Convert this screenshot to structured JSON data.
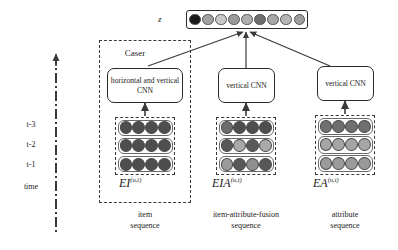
{
  "figure": {
    "output_label": "z",
    "time_axis": {
      "ticks": [
        "t-3",
        "t-2",
        "t-1",
        "time"
      ]
    },
    "output_vector": {
      "name": "z",
      "cells": [
        "#1a1a1a",
        "#a2a2a2",
        "#c9c9c9",
        "#9a9a9a",
        "#aeaeae",
        "#6e6e6e",
        "#a8a8a8",
        "#b6b6b6",
        "#9f9f9f"
      ]
    },
    "branches": [
      {
        "id": "item",
        "group_label": "Caser",
        "cnn_label": "horizontal and vertical CNN",
        "math_base": "EI",
        "math_sup": "(u,t)",
        "caption_line1": "item",
        "caption_line2": "sequence",
        "matrix": {
          "rows": 3,
          "cols": 4,
          "colors": [
            [
              "#4e4e4e",
              "#4e4e4e",
              "#4e4e4e",
              "#4e4e4e"
            ],
            [
              "#4e4e4e",
              "#4e4e4e",
              "#4e4e4e",
              "#4e4e4e"
            ],
            [
              "#4e4e4e",
              "#4e4e4e",
              "#4e4e4e",
              "#4e4e4e"
            ]
          ]
        }
      },
      {
        "id": "item-attribute-fusion",
        "group_label": "",
        "cnn_label": "vertical CNN",
        "math_base": "EIA",
        "math_sup": "(u,t)",
        "caption_line1": "item-attribute-fusion",
        "caption_line2": "sequence",
        "matrix": {
          "rows": 3,
          "cols": 4,
          "colors": [
            [
              "#6d6d6d",
              "#4e4e4e",
              "#4e4e4e",
              "#4e4e4e"
            ],
            [
              "#585858",
              "#a9a9a9",
              "#5a5a5a",
              "#a9a9a9"
            ],
            [
              "#9b9b9b",
              "#585858",
              "#8f8f8f",
              "#585858"
            ]
          ]
        }
      },
      {
        "id": "attribute",
        "group_label": "",
        "cnn_label": "vertical CNN",
        "math_base": "EA",
        "math_sup": "(u,t)",
        "caption_line1": "attribute",
        "caption_line2": "sequence",
        "matrix": {
          "rows": 3,
          "cols": 4,
          "colors": [
            [
              "#6f6f6f",
              "#6f6f6f",
              "#6f6f6f",
              "#6f6f6f"
            ],
            [
              "#a5a5a5",
              "#a5a5a5",
              "#a5a5a5",
              "#a5a5a5"
            ],
            [
              "#9a9a9a",
              "#9a9a9a",
              "#9a9a9a",
              "#9a9a9a"
            ]
          ]
        }
      }
    ],
    "colors": {
      "stroke": "#2a2a2a",
      "dashed": "#3a3a3a",
      "background": "#ffffff"
    }
  }
}
